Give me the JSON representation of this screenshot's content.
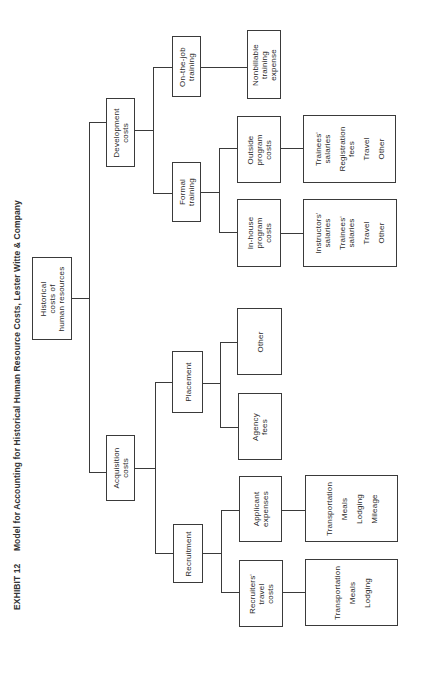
{
  "title": {
    "exhibit": "EXHIBIT 12",
    "text": "Model for Accounting for Historical Human Resource Costs, Lester Witte & Company"
  },
  "diagram": {
    "orientation": "rotated 90° counter-clockwise",
    "root": {
      "label": [
        "Historical",
        "costs of",
        "human resources"
      ]
    },
    "development": {
      "label": [
        "Development",
        "costs"
      ],
      "on_the_job": {
        "label": [
          "On-the-job",
          "training"
        ],
        "detail": {
          "label": [
            "Nonbillable",
            "training",
            "expense"
          ]
        }
      },
      "formal": {
        "label": [
          "Formal",
          "training"
        ],
        "outside": {
          "label": [
            "Outside",
            "program",
            "costs"
          ],
          "items": [
            "Trainees' salaries",
            "Registration fees",
            "Travel",
            "Other"
          ]
        },
        "in_house": {
          "label": [
            "In-house",
            "program",
            "costs"
          ],
          "items": [
            "Instructors' salaries",
            "Trainees' salaries",
            "Travel",
            "Other"
          ]
        }
      }
    },
    "acquisition": {
      "label": [
        "Acquisition",
        "costs"
      ],
      "placement": {
        "label": [
          "Placement"
        ],
        "other": {
          "label": [
            "Other"
          ]
        },
        "agency": {
          "label": [
            "Agency",
            "fees"
          ]
        }
      },
      "recruitment": {
        "label": [
          "Recruitment"
        ],
        "applicant": {
          "label": [
            "Applicant",
            "expenses"
          ],
          "items": [
            "Transportation",
            "Meals",
            "Lodging",
            "Mileage"
          ]
        },
        "recruiters": {
          "label": [
            "Recruiters'",
            "travel",
            "costs"
          ],
          "items": [
            "Transportation",
            "Meals",
            "Lodging"
          ]
        }
      }
    }
  }
}
